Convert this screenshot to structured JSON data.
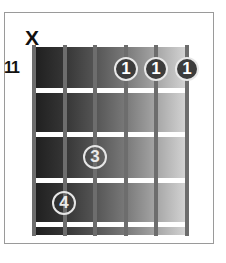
{
  "diagram": {
    "type": "guitar-chord-diagram",
    "fret_label": "11",
    "muted_string_marker": "X",
    "muted_string": 1,
    "strings": 6,
    "frets_shown": 4,
    "fingers": [
      {
        "string": 4,
        "fret": 1,
        "label": "1"
      },
      {
        "string": 5,
        "fret": 1,
        "label": "1"
      },
      {
        "string": 6,
        "fret": 1,
        "label": "1"
      },
      {
        "string": 3,
        "fret": 3,
        "label": "3"
      },
      {
        "string": 2,
        "fret": 4,
        "label": "4"
      }
    ],
    "colors": {
      "board_dark": "#1e1e1e",
      "board_light": "#d8d8d8",
      "string": "#6d6d6d",
      "fret": "#ffffff",
      "dot_fill": "#3c3c3c"
    }
  }
}
